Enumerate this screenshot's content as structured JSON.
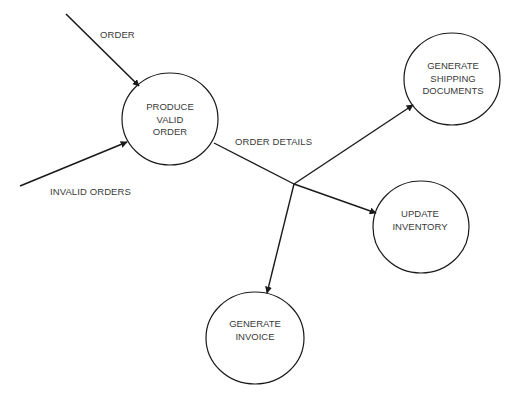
{
  "diagram": {
    "type": "data-flow-diagram",
    "colors": {
      "stroke": "#1a1a1a",
      "text": "#3a3a3a",
      "background": "#ffffff"
    },
    "processes": [
      {
        "id": "produce",
        "lines": [
          "PRODUCE",
          "VALID",
          "ORDER"
        ],
        "cx": 170,
        "cy": 119,
        "rx": 48,
        "ry": 46
      },
      {
        "id": "shipping",
        "lines": [
          "GENERATE",
          "SHIPPING",
          "DOCUMENTS"
        ],
        "cx": 452,
        "cy": 79,
        "rx": 48,
        "ry": 46
      },
      {
        "id": "inventory",
        "lines": [
          "UPDATE",
          "INVENTORY"
        ],
        "cx": 421,
        "cy": 227,
        "rx": 48,
        "ry": 46
      },
      {
        "id": "invoice",
        "lines": [
          "GENERATE",
          "INVOICE"
        ],
        "cx": 255,
        "cy": 338,
        "rx": 49,
        "ry": 46
      }
    ],
    "flows": [
      {
        "label": "ORDER",
        "from": "external",
        "to": "produce"
      },
      {
        "label": "INVALID ORDERS",
        "from": "external",
        "to": "produce"
      },
      {
        "label": "ORDER DETAILS",
        "from": "produce",
        "to": [
          "shipping",
          "inventory",
          "invoice"
        ]
      }
    ],
    "labels": {
      "order": "ORDER",
      "invalid_orders": "INVALID ORDERS",
      "order_details": "ORDER DETAILS"
    },
    "nodes": {
      "produce": {
        "l1": "PRODUCE",
        "l2": "VALID",
        "l3": "ORDER"
      },
      "shipping": {
        "l1": "GENERATE",
        "l2": "SHIPPING",
        "l3": "DOCUMENTS"
      },
      "inventory": {
        "l1": "UPDATE",
        "l2": "INVENTORY"
      },
      "invoice": {
        "l1": "GENERATE",
        "l2": "INVOICE"
      }
    }
  }
}
